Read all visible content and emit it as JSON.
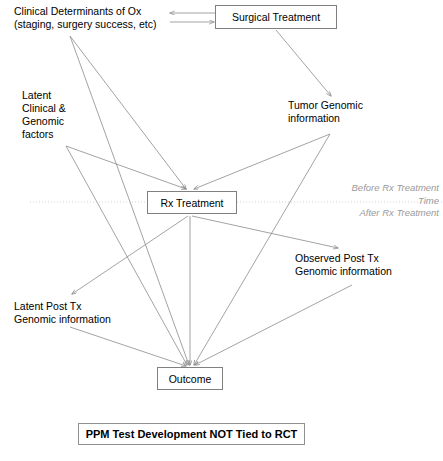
{
  "diagram": {
    "title_banner": "PPM Test Development NOT Tied to RCT",
    "time_legend": {
      "before": "Before Rx Treatment",
      "axis": "Time",
      "after": "After Rx Treatment"
    },
    "nodes": [
      {
        "id": "clinical-determinants",
        "kind": "text",
        "label": "Clinical Determinants of Ox\n(staging, surgery success, etc)",
        "x": 14,
        "y": 5,
        "width": 170
      },
      {
        "id": "surgical-treatment",
        "kind": "box",
        "label": "Surgical Treatment",
        "x": 215,
        "y": 5,
        "width": 122,
        "height": 24
      },
      {
        "id": "latent-clinical-genomic",
        "kind": "text",
        "label": "Latent\nClinical &\nGenomic\nfactors",
        "x": 22,
        "y": 89,
        "width": 70
      },
      {
        "id": "tumor-genomic",
        "kind": "text",
        "label": "Tumor Genomic\ninformation",
        "x": 288,
        "y": 99,
        "width": 100
      },
      {
        "id": "rx-treatment",
        "kind": "box",
        "label": "Rx Treatment",
        "x": 147,
        "y": 191,
        "width": 90,
        "height": 23
      },
      {
        "id": "observed-post-tx",
        "kind": "text",
        "label": "Observed Post Tx\nGenomic information",
        "x": 295,
        "y": 252,
        "width": 125
      },
      {
        "id": "latent-post-tx",
        "kind": "text",
        "label": "Latent Post Tx\nGenomic information",
        "x": 14,
        "y": 300,
        "width": 125
      },
      {
        "id": "outcome",
        "kind": "box",
        "label": "Outcome",
        "x": 157,
        "y": 367,
        "width": 66,
        "height": 23
      }
    ],
    "edges": [
      {
        "from": "surgical-treatment",
        "to": "clinical-determinants",
        "x1": 215,
        "y1": 13,
        "x2": 170,
        "y2": 13,
        "style": "solid"
      },
      {
        "from": "clinical-determinants",
        "to": "surgical-treatment",
        "x1": 170,
        "y1": 22,
        "x2": 214,
        "y2": 22,
        "style": "solid"
      },
      {
        "from": "surgical-treatment",
        "to": "tumor-genomic",
        "x1": 276,
        "y1": 30,
        "x2": 331,
        "y2": 96,
        "style": "solid"
      },
      {
        "from": "clinical-determinants",
        "to": "rx-treatment",
        "x1": 70,
        "y1": 36,
        "x2": 186,
        "y2": 189,
        "style": "solid"
      },
      {
        "from": "clinical-determinants",
        "to": "outcome",
        "x1": 70,
        "y1": 36,
        "x2": 189,
        "y2": 365,
        "style": "solid"
      },
      {
        "from": "latent-clinical-genomic",
        "to": "rx-treatment",
        "x1": 66,
        "y1": 146,
        "x2": 186,
        "y2": 189,
        "style": "solid"
      },
      {
        "from": "latent-clinical-genomic",
        "to": "outcome",
        "x1": 66,
        "y1": 146,
        "x2": 187,
        "y2": 365,
        "style": "solid"
      },
      {
        "from": "tumor-genomic",
        "to": "rx-treatment",
        "x1": 330,
        "y1": 134,
        "x2": 194,
        "y2": 189,
        "style": "solid"
      },
      {
        "from": "tumor-genomic",
        "to": "outcome",
        "x1": 330,
        "y1": 134,
        "x2": 194,
        "y2": 365,
        "style": "solid"
      },
      {
        "from": "rx-treatment",
        "to": "latent-post-tx",
        "x1": 188,
        "y1": 216,
        "x2": 72,
        "y2": 294,
        "style": "solid"
      },
      {
        "from": "rx-treatment",
        "to": "observed-post-tx",
        "x1": 192,
        "y1": 216,
        "x2": 338,
        "y2": 248,
        "style": "solid"
      },
      {
        "from": "rx-treatment",
        "to": "outcome",
        "x1": 190,
        "y1": 216,
        "x2": 190,
        "y2": 365,
        "style": "solid"
      },
      {
        "from": "latent-post-tx",
        "to": "outcome",
        "x1": 70,
        "y1": 327,
        "x2": 186,
        "y2": 366,
        "style": "solid"
      },
      {
        "from": "observed-post-tx",
        "to": "outcome",
        "x1": 352,
        "y1": 285,
        "x2": 195,
        "y2": 365,
        "style": "solid"
      }
    ],
    "time_axis": {
      "x1": 30,
      "x2": 443,
      "y": 202,
      "style": "dotted"
    },
    "colors": {
      "line": "#8c8c8c",
      "text": "#000000",
      "legend_text": "#9a9a9a",
      "box_border": "#808080",
      "background": "#ffffff"
    }
  }
}
